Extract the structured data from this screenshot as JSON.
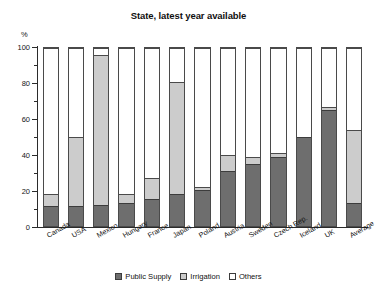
{
  "chart_data": {
    "type": "bar",
    "title": "State, latest year available",
    "subtitle": "",
    "xlabel": "",
    "ylabel": "%",
    "ylim": [
      0,
      100
    ],
    "yticks": [
      0,
      20,
      40,
      60,
      80,
      100
    ],
    "ytick_labels": [
      "0",
      "20",
      "40",
      "60",
      "80",
      "100"
    ],
    "y_minor_ticks": [
      10,
      30,
      50,
      70,
      90
    ],
    "grid": false,
    "stacked": true,
    "legend_position": "bottom",
    "categories": [
      "Canada",
      "USA",
      "Mexico",
      "Hungary",
      "France",
      "Japan",
      "Poland",
      "Austria",
      "Sweden",
      "Czech Rep.",
      "Iceland",
      "UK",
      "Average"
    ],
    "series": [
      {
        "name": "Public Supply",
        "color": "#6e6e6e",
        "values": [
          11,
          11,
          12,
          13,
          15,
          18,
          20,
          31,
          35,
          39,
          50,
          65,
          13
        ]
      },
      {
        "name": "Irrigation",
        "color": "#cccccc",
        "values": [
          7,
          39,
          84,
          5,
          12,
          63,
          2,
          9,
          4,
          2,
          0,
          2,
          41
        ]
      },
      {
        "name": "Others",
        "color": "#ffffff",
        "values": [
          82,
          50,
          4,
          82,
          73,
          19,
          78,
          60,
          61,
          59,
          50,
          33,
          46
        ]
      }
    ],
    "cumulative_tops": {
      "public_supply": [
        11,
        11,
        12,
        13,
        15,
        18,
        20,
        31,
        35,
        39,
        50,
        65,
        13
      ],
      "irrigation": [
        18,
        50,
        96,
        18,
        27,
        81,
        22,
        40,
        39,
        41,
        50,
        67,
        54
      ],
      "others": [
        100,
        100,
        100,
        100,
        100,
        100,
        100,
        100,
        100,
        100,
        100,
        100,
        100
      ]
    }
  },
  "legend": {
    "items": [
      {
        "label": "Public Supply",
        "swatch": "dark-gray-swatch"
      },
      {
        "label": "Irrigation",
        "swatch": "light-gray-swatch"
      },
      {
        "label": "Others",
        "swatch": "white-swatch"
      }
    ]
  }
}
